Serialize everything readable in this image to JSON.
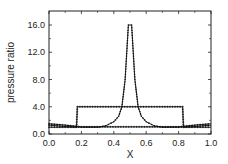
{
  "chart_data": {
    "type": "line",
    "title": "",
    "xlabel": "X",
    "ylabel": "pressure ratio",
    "xlim": [
      0.0,
      1.0
    ],
    "ylim": [
      0.0,
      18.0
    ],
    "xticks": [
      "0.0",
      "0.2",
      "0.4",
      "0.6",
      "0.8",
      "1.0"
    ],
    "yticks": [
      "0.0",
      "4.0",
      "8.0",
      "12.0",
      "16.0"
    ],
    "grid": false,
    "legend": null,
    "series": [
      {
        "name": "peaked profile",
        "marker": "small dots",
        "x": [
          0.0,
          0.05,
          0.1,
          0.15,
          0.2,
          0.25,
          0.3,
          0.35,
          0.4,
          0.43,
          0.45,
          0.47,
          0.49,
          0.51,
          0.53,
          0.55,
          0.57,
          0.6,
          0.65,
          0.7,
          0.75,
          0.8,
          0.85,
          0.9,
          0.95,
          1.0
        ],
        "y": [
          1.3,
          1.2,
          1.1,
          1.05,
          1.0,
          1.0,
          1.0,
          1.2,
          1.8,
          2.6,
          4.0,
          8.0,
          16.0,
          16.0,
          8.0,
          4.0,
          2.6,
          1.8,
          1.2,
          1.0,
          1.0,
          1.0,
          1.05,
          1.1,
          1.2,
          1.3
        ]
      },
      {
        "name": "step profile",
        "marker": "crosses",
        "x": [
          0.0,
          0.1,
          0.17,
          0.175,
          0.3,
          0.5,
          0.7,
          0.825,
          0.83,
          0.9,
          1.0
        ],
        "y": [
          1.0,
          1.0,
          1.0,
          4.0,
          4.0,
          4.0,
          4.0,
          4.0,
          1.0,
          1.0,
          1.0
        ]
      },
      {
        "name": "baseline profile",
        "marker": "crosses",
        "x": [
          0.0,
          0.1,
          0.2,
          0.8,
          0.9,
          1.0
        ],
        "y": [
          1.5,
          1.3,
          1.05,
          1.05,
          1.3,
          1.5
        ]
      }
    ]
  }
}
